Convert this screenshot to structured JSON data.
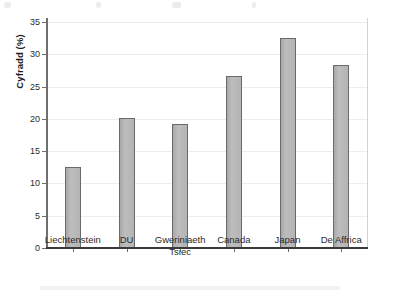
{
  "chart_data": {
    "type": "bar",
    "title": "",
    "xlabel": "",
    "ylabel": "Cyfradd (%)",
    "categories": [
      "Liechtenstein",
      "DU",
      "Gweriniaeth Tsiec",
      "Canada",
      "Japan",
      "De Affrica"
    ],
    "category_lines": [
      [
        "Liechtenstein"
      ],
      [
        "DU"
      ],
      [
        "Gweriniaeth",
        "Tsiec"
      ],
      [
        "Canada"
      ],
      [
        "Japan"
      ],
      [
        "De Affrica"
      ]
    ],
    "values": [
      12.5,
      20.1,
      19.2,
      26.6,
      32.5,
      28.3
    ],
    "ylim": [
      0,
      35
    ],
    "ytick_step": 5,
    "yticks": [
      0,
      5,
      10,
      15,
      20,
      25,
      30,
      35
    ],
    "ytick_labels": [
      "0",
      "5",
      "10",
      "15",
      "20",
      "25",
      "30",
      "35"
    ],
    "grid": true,
    "grid_axis": "y",
    "legend": false,
    "legend_position": "none",
    "bar_fill_color": "#b4b4b4",
    "bar_edge_color": "#6a6a6a",
    "gridline_color": "#ececec",
    "axis_color": "#6f6f6f",
    "baseline_color": "#3a3a3a",
    "text_color": "#2b2b2b"
  }
}
